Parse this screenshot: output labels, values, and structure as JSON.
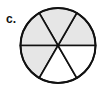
{
  "label": "c.",
  "diagram": {
    "type": "fraction-circle",
    "sectors_total": 6,
    "sectors_shaded": 4,
    "fraction_shaded": "4/6",
    "shade_color": "#e6e6e6",
    "unshaded_color": "#ffffff",
    "stroke_color": "#111111",
    "sectors": [
      {
        "from_deg": 0,
        "to_deg": 60,
        "shaded": true
      },
      {
        "from_deg": 60,
        "to_deg": 120,
        "shaded": true
      },
      {
        "from_deg": 120,
        "to_deg": 180,
        "shaded": true
      },
      {
        "from_deg": 180,
        "to_deg": 240,
        "shaded": true
      },
      {
        "from_deg": 240,
        "to_deg": 300,
        "shaded": false
      },
      {
        "from_deg": 300,
        "to_deg": 360,
        "shaded": false
      }
    ]
  }
}
